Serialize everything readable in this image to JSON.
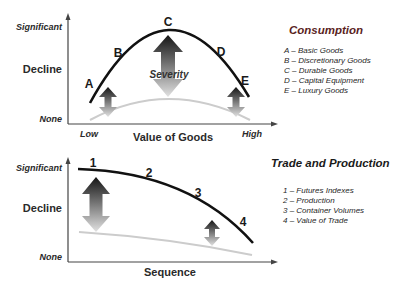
{
  "colors": {
    "curve_primary": "#111111",
    "curve_baseline": "#c8c8c8",
    "axis": "#444444",
    "consumption_title": "#5a1e1e",
    "trade_title": "#1a1a1a",
    "arrow_dark": "#1a1a1a",
    "arrow_light": "#d8d8d8"
  },
  "top_chart": {
    "y_axis": {
      "top_label": "Significant",
      "mid_label": "Decline",
      "bottom_label": "None"
    },
    "x_axis": {
      "left_label": "Low",
      "title": "Value of Goods",
      "right_label": "High"
    },
    "points": [
      {
        "label": "A"
      },
      {
        "label": "B"
      },
      {
        "label": "C"
      },
      {
        "label": "D"
      },
      {
        "label": "E"
      }
    ],
    "center_annotation": "Severity",
    "legend": {
      "title": "Consumption",
      "items": [
        "A – Basic Goods",
        "B – Discretionary Goods",
        "C – Durable Goods",
        "D – Capital Equipment",
        "E – Luxury Goods"
      ]
    }
  },
  "bottom_chart": {
    "y_axis": {
      "top_label": "Significant",
      "mid_label": "Decline",
      "bottom_label": "None"
    },
    "x_axis": {
      "title": "Sequence"
    },
    "points": [
      {
        "label": "1"
      },
      {
        "label": "2"
      },
      {
        "label": "3"
      },
      {
        "label": "4"
      }
    ],
    "legend": {
      "title": "Trade and Production",
      "items": [
        "1 – Futures Indexes",
        "2 – Production",
        "3 – Container Volumes",
        "4 – Value of Trade"
      ]
    }
  }
}
